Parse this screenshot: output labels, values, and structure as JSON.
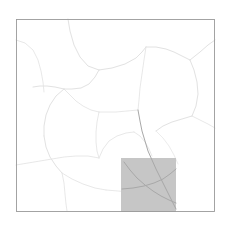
{
  "figure": {
    "type": "map",
    "title": "",
    "background_color": "#ffffff",
    "width": 230,
    "height": 229
  },
  "frame": {
    "name": "map-frame",
    "x": 16.5,
    "y": 19.5,
    "width": 198,
    "height": 192,
    "stroke_color": "#9a9a9a",
    "stroke_width": 0.9
  },
  "highlight": {
    "name": "highlighted-cell",
    "x": 121,
    "y": 158,
    "width": 55,
    "height": 54,
    "fill_color": "#c6c6c6",
    "opacity": 1
  },
  "style": {
    "road_color": "#e2e2e2",
    "road_color_dark": "#a8a8a8",
    "road_color_faint": "#ececec",
    "road_width_major": 1.0,
    "road_width_minor": 0.8
  },
  "chart_data": {
    "type": "map",
    "title": "",
    "xlabel": "",
    "ylabel": "",
    "grid": false,
    "legend": null,
    "xlim": [
      16,
      215
    ],
    "ylim": [
      19,
      212
    ],
    "highlight_cells": [
      {
        "x0": 121,
        "y0": 158,
        "x1": 176,
        "y1": 212,
        "value": 1,
        "color": "#c6c6c6"
      }
    ],
    "network": {
      "name": "road-network",
      "edge_count": 26,
      "edges": [
        {
          "id": "r01",
          "kind": "major",
          "points": "68,19 70,31 74,45 80,57 88,66 99,70"
        },
        {
          "id": "r02",
          "kind": "major",
          "points": "99,70 112,68 125,64 136,58 142,52 146,47"
        },
        {
          "id": "r03",
          "kind": "major",
          "points": "146,47 156,47 166,49 174,52 182,56 190,60"
        },
        {
          "id": "r04",
          "kind": "major",
          "points": "190,60 200,52 208,45 215,40"
        },
        {
          "id": "r05",
          "kind": "major",
          "points": "190,60 194,70 197,82 198,94 196,106 192,116"
        },
        {
          "id": "r06",
          "kind": "major",
          "points": "192,116 182,119 172,122 163,126 156,131"
        },
        {
          "id": "r07",
          "kind": "minor",
          "points": "146,47 144,60 142,74 140,88 139,100 138,110"
        },
        {
          "id": "r08",
          "kind": "minor",
          "points": "138,110 127,111 116,112 106,112 99,112"
        },
        {
          "id": "r09",
          "kind": "minor",
          "points": "99,112 91,110 83,106 76,101 70,95 64,89"
        },
        {
          "id": "r10",
          "kind": "major",
          "points": "64,89 55,87 47,86 40,86 33,87"
        },
        {
          "id": "r11",
          "kind": "major",
          "points": "99,70 95,77 89,84 81,88 72,89 64,89"
        },
        {
          "id": "r12",
          "kind": "major",
          "points": "64,89 56,96 50,105 46,115 44,126 44,136"
        },
        {
          "id": "r13",
          "kind": "major",
          "points": "44,136 46,147 50,157 56,166 62,173"
        },
        {
          "id": "r14",
          "kind": "minor",
          "points": "62,173 72,179 83,184 95,188 106,190"
        },
        {
          "id": "r15",
          "kind": "minor",
          "points": "106,190 118,191 130,192 142,193 152,195"
        },
        {
          "id": "r16",
          "kind": "minor",
          "points": "99,112 97,122 96,132 96,142 97,151 99,158"
        },
        {
          "id": "r17",
          "kind": "minor",
          "points": "99,158 103,149 109,141 117,136 126,133 134,132"
        },
        {
          "id": "r18",
          "kind": "minor",
          "points": "134,132 140,136 145,142 149,149 152,156"
        },
        {
          "id": "r19",
          "kind": "dark",
          "points": "138,110 140,121 142,131 145,141 148,151 152,160 156,169 161,179 166,189 171,199 176,209"
        },
        {
          "id": "r20",
          "kind": "dark",
          "points": "124,162 130,170 137,178 145,185 153,191 161,196 169,200 176,203"
        },
        {
          "id": "r21",
          "kind": "dark",
          "points": "122,189 133,188 144,186 154,183 163,179 170,174 176,169"
        },
        {
          "id": "r22",
          "kind": "minor",
          "points": "16,165 28,163 40,161 52,159 64,157 76,156 88,156 99,158"
        },
        {
          "id": "r23",
          "kind": "minor",
          "points": "16,40 25,43 33,50 38,60 41,71 43,82 44,92"
        },
        {
          "id": "r24",
          "kind": "minor",
          "points": "62,173 64,183 65,194 66,204 67,211"
        },
        {
          "id": "r25",
          "kind": "minor",
          "points": "192,116 200,120 208,124 215,128"
        },
        {
          "id": "r26",
          "kind": "faint",
          "points": "156,131 163,138 169,146 174,155 178,164"
        }
      ]
    }
  }
}
